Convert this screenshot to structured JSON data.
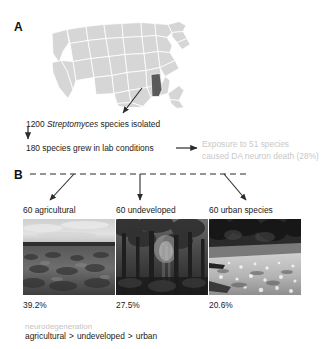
{
  "figure": {
    "panel_a_letter": "A",
    "panel_b_letter": "B"
  },
  "map": {
    "highlighted_state": "Alabama",
    "base_color": "#d6d6d6",
    "border_color": "#ffffff",
    "highlight_color": "#5a5a5a"
  },
  "flow": {
    "line1_prefix": "1200 ",
    "line1_species": "Streptomyces",
    "line1_suffix": " species isolated",
    "line2": "180 species grew in lab conditions",
    "result_line1": "Exposure to 51 species",
    "result_line2": "caused DA neuron death (28%)",
    "result_color": "#c9c9c9"
  },
  "groups": [
    {
      "label": "60 agricultural",
      "percent": "39.2%",
      "scene": "agricultural-field"
    },
    {
      "label": "60 undeveloped",
      "percent": "27.5%",
      "scene": "undeveloped-forest"
    },
    {
      "label": "60 urban species",
      "percent": "20.6%",
      "scene": "urban-roadside"
    }
  ],
  "footer": {
    "caption": "neurodegeneration",
    "caption_color": "#c4c4c4",
    "rank_1": "agricultural",
    "rank_op_1": ">",
    "rank_2": "undeveloped",
    "rank_op_2": ">",
    "rank_3": "urban"
  }
}
